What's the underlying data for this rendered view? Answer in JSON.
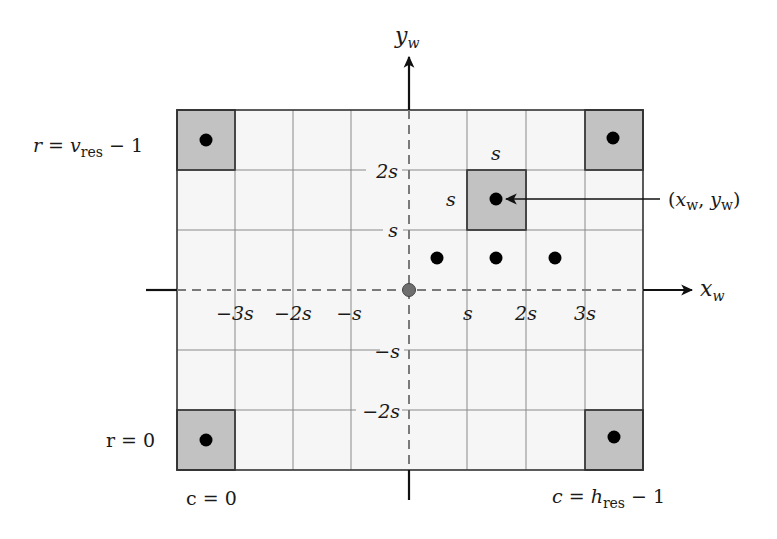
{
  "diagram": {
    "grid": {
      "columns": 8,
      "rows": 6,
      "cell_size_label": "s",
      "light_cell_color": "#f6f6f6",
      "highlight_cell_color": "#c2c2c2",
      "grid_line_color": "#8a8a8a",
      "border_color": "#333333",
      "highlighted_cells": [
        {
          "col": 0,
          "row": 0,
          "name": "top-left-corner"
        },
        {
          "col": 7,
          "row": 0,
          "name": "top-right-corner"
        },
        {
          "col": 0,
          "row": 5,
          "name": "bottom-left-corner"
        },
        {
          "col": 7,
          "row": 5,
          "name": "bottom-right-corner"
        },
        {
          "col": 5,
          "row": 1,
          "name": "sample-pixel"
        }
      ],
      "sample_points": [
        {
          "col": 4,
          "row": 2
        },
        {
          "col": 5,
          "row": 2
        },
        {
          "col": 6,
          "row": 2
        }
      ]
    },
    "axes": {
      "x_label": "x",
      "x_label_sub": "w",
      "y_label": "y",
      "y_label_sub": "w",
      "x_ticks": [
        "−3s",
        "−2s",
        "−s",
        "s",
        "2s",
        "3s"
      ],
      "y_ticks": [
        "2s",
        "s",
        "−s",
        "−2s"
      ]
    },
    "annotations": {
      "cell_width_label": "s",
      "cell_height_label": "s",
      "point_label_open": "(",
      "point_label_x": "x",
      "point_label_x_sub": "w",
      "point_label_sep": ", ",
      "point_label_y": "y",
      "point_label_y_sub": "w",
      "point_label_close": ")",
      "row_top_label_prefix": "r = ",
      "row_top_label_var": "v",
      "row_top_label_sub": "res",
      "row_top_label_suffix": " − 1",
      "row_bottom_label": "r = 0",
      "col_left_label": "c = 0",
      "col_right_label_prefix": "c = ",
      "col_right_label_var": "h",
      "col_right_label_sub": "res",
      "col_right_label_suffix": " − 1"
    },
    "origin_color": "#6e6e6e"
  }
}
